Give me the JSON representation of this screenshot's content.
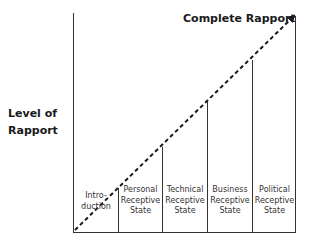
{
  "diagram": {
    "title": "Complete Rapport",
    "y_axis_label_line1": "Level of",
    "y_axis_label_line2": "Rapport",
    "columns": [
      {
        "line1": "Intro-",
        "line2": "duction",
        "line3": ""
      },
      {
        "line1": "Personal",
        "line2": "Receptive",
        "line3": "State"
      },
      {
        "line1": "Technical",
        "line2": "Receptive",
        "line3": "State"
      },
      {
        "line1": "Business",
        "line2": "Receptive",
        "line3": "State"
      },
      {
        "line1": "Political",
        "line2": "Receptive",
        "line3": "State"
      }
    ],
    "colors": {
      "line": "#1a1a1a",
      "text": "#1a1a1a"
    }
  }
}
